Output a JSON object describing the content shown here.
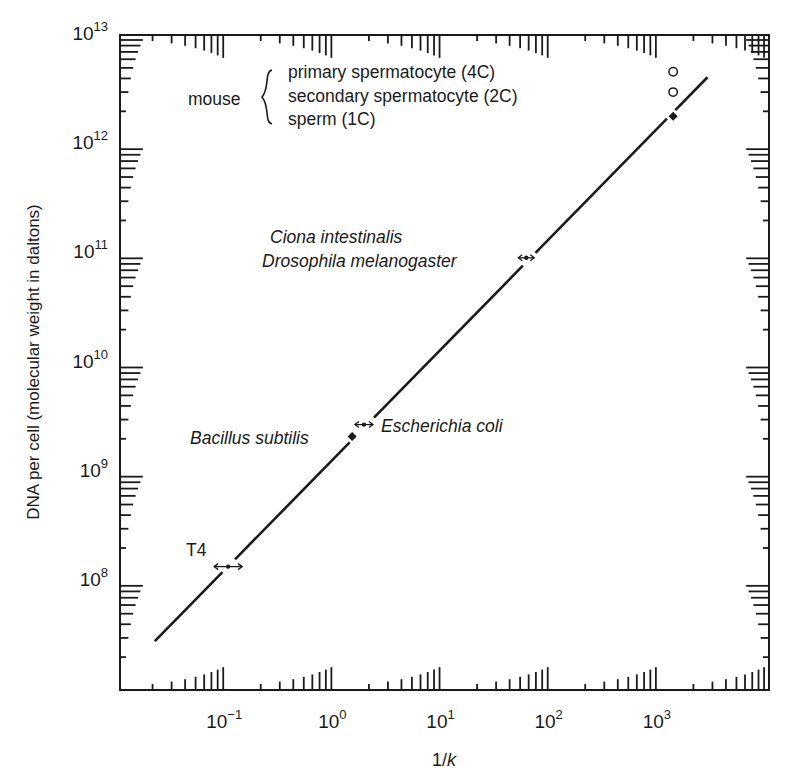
{
  "chart_data": {
    "type": "line",
    "title": "",
    "xlabel": "1/k",
    "ylabel": "DNA per cell (molecular weight in daltons)",
    "xscale": "log",
    "yscale": "log",
    "xlim": [
      0.01,
      10000
    ],
    "ylim": [
      10000000.0,
      10000000000000.0
    ],
    "x_ticks": [
      {
        "value": 0.1,
        "base": "10",
        "exp": "−1"
      },
      {
        "value": 1,
        "base": "10",
        "exp": "0"
      },
      {
        "value": 10,
        "base": "10",
        "exp": "1"
      },
      {
        "value": 100,
        "base": "10",
        "exp": "2"
      },
      {
        "value": 1000,
        "base": "10",
        "exp": "3"
      }
    ],
    "y_ticks": [
      {
        "value": 100000000.0,
        "base": "10",
        "exp": "8"
      },
      {
        "value": 1000000000.0,
        "base": "10",
        "exp": "9"
      },
      {
        "value": 10000000000.0,
        "base": "10",
        "exp": "10"
      },
      {
        "value": 100000000000.0,
        "base": "10",
        "exp": "11"
      },
      {
        "value": 1000000000000.0,
        "base": "10",
        "exp": "12"
      },
      {
        "value": 10000000000000.0,
        "base": "10",
        "exp": "13"
      }
    ],
    "grid": false,
    "legend": null,
    "series": [
      {
        "name": "fit line",
        "style": "solid",
        "x": [
          0.021,
          2700
        ],
        "y": [
          28000000.0,
          4100000000000.0
        ]
      }
    ],
    "points": [
      {
        "label": "T4",
        "x": 0.1,
        "y": 135000000.0,
        "marker": "range-arrow",
        "label_italic": false
      },
      {
        "label": "Escherichia coli",
        "x": 1.8,
        "y": 2700000000.0,
        "marker": "range-arrow",
        "label_italic": true
      },
      {
        "label": "Bacillus subtilis",
        "x": 1.4,
        "y": 2100000000.0,
        "marker": "filled-diamond",
        "label_italic": true
      },
      {
        "label": "Drosophila melanogaster",
        "x": 57,
        "y": 91000000000.0,
        "marker": "range-arrow",
        "label_italic": true
      },
      {
        "label": "Ciona intestinalis",
        "x": 57,
        "y": 91000000000.0,
        "marker": "range-arrow",
        "label_italic": true
      },
      {
        "label": "mouse sperm (1C)",
        "x": 1300,
        "y": 1800000000000.0,
        "marker": "filled-diamond"
      },
      {
        "label": "mouse secondary spermatocyte (2C)",
        "x": 1300,
        "y": 3000000000000.0,
        "marker": "open-circle"
      },
      {
        "label": "mouse primary spermatocyte (4C)",
        "x": 1300,
        "y": 4600000000000.0,
        "marker": "open-circle"
      }
    ],
    "annotations": {
      "mouse_group": "mouse",
      "mouse_lines": [
        "primary spermatocyte (4C)",
        "secondary spermatocyte (2C)",
        "sperm (1C)"
      ],
      "ciona": "Ciona intestinalis",
      "drosophila": "Drosophila melanogaster",
      "bacillus": "Bacillus subtilis",
      "ecoli": "Escherichia coli",
      "t4": "T4"
    }
  },
  "colors": {
    "ink": "#1a1a1a",
    "background": "#ffffff"
  }
}
